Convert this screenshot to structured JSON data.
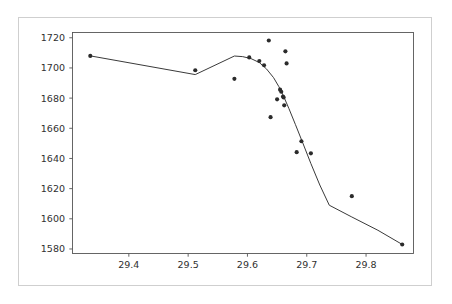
{
  "figure": {
    "background_color": "#ffffff",
    "frame_color": "#cfcfcf",
    "axis_color": "#555555",
    "marker_color": "#2b2b2b",
    "line_color": "#3a3a3a"
  },
  "chart_data": {
    "type": "scatter",
    "title": "",
    "xlabel": "",
    "ylabel": "",
    "xlim": [
      29.305,
      29.88
    ],
    "ylim": [
      1577.0,
      1723.5
    ],
    "grid": false,
    "legend": null,
    "xticks": [
      29.4,
      29.5,
      29.6,
      29.7,
      29.8
    ],
    "xtick_labels": [
      "29.4",
      "29.5",
      "29.6",
      "29.7",
      "29.8"
    ],
    "yticks": [
      1580,
      1600,
      1620,
      1640,
      1660,
      1680,
      1700,
      1720
    ],
    "ytick_labels": [
      "1580",
      "1600",
      "1620",
      "1640",
      "1660",
      "1680",
      "1700",
      "1720"
    ],
    "series": [
      {
        "name": "observations",
        "type": "scatter",
        "marker": "circle",
        "marker_size": 3.0,
        "color": "#2b2b2b",
        "points": [
          {
            "x": 29.335,
            "y": 1708.0
          },
          {
            "x": 29.512,
            "y": 1698.5
          },
          {
            "x": 29.578,
            "y": 1692.8
          },
          {
            "x": 29.603,
            "y": 1707.0
          },
          {
            "x": 29.62,
            "y": 1704.6
          },
          {
            "x": 29.628,
            "y": 1701.8
          },
          {
            "x": 29.636,
            "y": 1718.2
          },
          {
            "x": 29.639,
            "y": 1667.4
          },
          {
            "x": 29.65,
            "y": 1679.2
          },
          {
            "x": 29.655,
            "y": 1685.6
          },
          {
            "x": 29.657,
            "y": 1684.2
          },
          {
            "x": 29.66,
            "y": 1681.0
          },
          {
            "x": 29.661,
            "y": 1680.4
          },
          {
            "x": 29.662,
            "y": 1675.2
          },
          {
            "x": 29.664,
            "y": 1711.0
          },
          {
            "x": 29.666,
            "y": 1703.0
          },
          {
            "x": 29.683,
            "y": 1644.2
          },
          {
            "x": 29.691,
            "y": 1651.4
          },
          {
            "x": 29.707,
            "y": 1643.4
          },
          {
            "x": 29.776,
            "y": 1615.0
          },
          {
            "x": 29.861,
            "y": 1583.0
          }
        ]
      },
      {
        "name": "fitted-trend",
        "type": "line",
        "color": "#3a3a3a",
        "linewidth": 1.0,
        "points": [
          {
            "x": 29.335,
            "y": 1708.0
          },
          {
            "x": 29.512,
            "y": 1695.6
          },
          {
            "x": 29.578,
            "y": 1707.9
          },
          {
            "x": 29.592,
            "y": 1707.5
          },
          {
            "x": 29.606,
            "y": 1706.2
          },
          {
            "x": 29.62,
            "y": 1703.6
          },
          {
            "x": 29.632,
            "y": 1699.4
          },
          {
            "x": 29.644,
            "y": 1693.6
          },
          {
            "x": 29.653,
            "y": 1687.6
          },
          {
            "x": 29.661,
            "y": 1681.2
          },
          {
            "x": 29.67,
            "y": 1673.0
          },
          {
            "x": 29.681,
            "y": 1662.4
          },
          {
            "x": 29.694,
            "y": 1649.6
          },
          {
            "x": 29.707,
            "y": 1636.6
          },
          {
            "x": 29.722,
            "y": 1622.4
          },
          {
            "x": 29.738,
            "y": 1609.0
          },
          {
            "x": 29.776,
            "y": 1601.2
          },
          {
            "x": 29.82,
            "y": 1592.4
          },
          {
            "x": 29.861,
            "y": 1583.0
          }
        ]
      }
    ]
  }
}
